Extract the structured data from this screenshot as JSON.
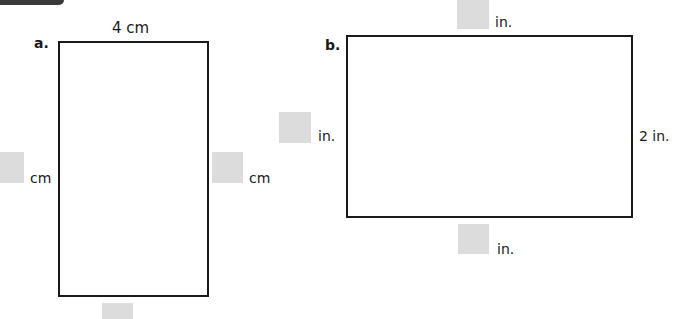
{
  "header": {
    "tab": ""
  },
  "problems": [
    {
      "letter": "a.",
      "shape": "rectangle",
      "top_label": "4 cm",
      "left_unit": "cm",
      "right_unit": "cm",
      "bottom_unit": ""
    },
    {
      "letter": "b.",
      "shape": "rectangle",
      "top_unit": "in.",
      "left_unit": "in.",
      "right_label": "2 in.",
      "bottom_unit": "in."
    }
  ],
  "colors": {
    "answer_box": "#dcdcdc",
    "outline": "#1a1a1a",
    "tab": "#3a3a3a"
  }
}
